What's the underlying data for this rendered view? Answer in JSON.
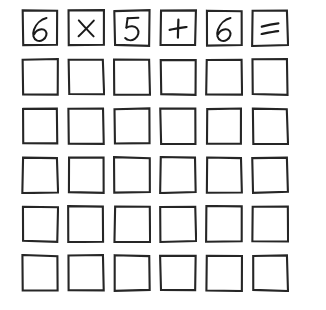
{
  "page": {
    "background_color": "#ffffff",
    "ink_color": "#1a1a1a",
    "border_color": "#262626",
    "width": 326,
    "height": 310
  },
  "grid": {
    "rows": 6,
    "columns": 6,
    "cell_size": 38,
    "column_gap": 8,
    "row_gap": 11,
    "origin_x": 21,
    "origin_y": 9,
    "border_width": 2,
    "style": "hand-drawn"
  },
  "expression": {
    "text": "6 × 5 + 6 =",
    "operands": [
      6,
      5,
      6
    ],
    "operators": [
      "×",
      "+"
    ],
    "terminator": "="
  },
  "cells": [
    [
      {
        "value": "6",
        "glyph": "digit-six",
        "filled": true
      },
      {
        "value": "×",
        "glyph": "multiplication-sign",
        "filled": true
      },
      {
        "value": "5",
        "glyph": "digit-five",
        "filled": true
      },
      {
        "value": "+",
        "glyph": "plus-sign",
        "filled": true
      },
      {
        "value": "6",
        "glyph": "digit-six",
        "filled": true
      },
      {
        "value": "=",
        "glyph": "equals-sign",
        "filled": true
      }
    ],
    [
      {
        "value": "",
        "glyph": "empty",
        "filled": false
      },
      {
        "value": "",
        "glyph": "empty",
        "filled": false
      },
      {
        "value": "",
        "glyph": "empty",
        "filled": false
      },
      {
        "value": "",
        "glyph": "empty",
        "filled": false
      },
      {
        "value": "",
        "glyph": "empty",
        "filled": false
      },
      {
        "value": "",
        "glyph": "empty",
        "filled": false
      }
    ],
    [
      {
        "value": "",
        "glyph": "empty",
        "filled": false
      },
      {
        "value": "",
        "glyph": "empty",
        "filled": false
      },
      {
        "value": "",
        "glyph": "empty",
        "filled": false
      },
      {
        "value": "",
        "glyph": "empty",
        "filled": false
      },
      {
        "value": "",
        "glyph": "empty",
        "filled": false
      },
      {
        "value": "",
        "glyph": "empty",
        "filled": false
      }
    ],
    [
      {
        "value": "",
        "glyph": "empty",
        "filled": false
      },
      {
        "value": "",
        "glyph": "empty",
        "filled": false
      },
      {
        "value": "",
        "glyph": "empty",
        "filled": false
      },
      {
        "value": "",
        "glyph": "empty",
        "filled": false
      },
      {
        "value": "",
        "glyph": "empty",
        "filled": false
      },
      {
        "value": "",
        "glyph": "empty",
        "filled": false
      }
    ],
    [
      {
        "value": "",
        "glyph": "empty",
        "filled": false
      },
      {
        "value": "",
        "glyph": "empty",
        "filled": false
      },
      {
        "value": "",
        "glyph": "empty",
        "filled": false
      },
      {
        "value": "",
        "glyph": "empty",
        "filled": false
      },
      {
        "value": "",
        "glyph": "empty",
        "filled": false
      },
      {
        "value": "",
        "glyph": "empty",
        "filled": false
      }
    ],
    [
      {
        "value": "",
        "glyph": "empty",
        "filled": false
      },
      {
        "value": "",
        "glyph": "empty",
        "filled": false
      },
      {
        "value": "",
        "glyph": "empty",
        "filled": false
      },
      {
        "value": "",
        "glyph": "empty",
        "filled": false
      },
      {
        "value": "",
        "glyph": "empty",
        "filled": false
      },
      {
        "value": "",
        "glyph": "empty",
        "filled": false
      }
    ]
  ]
}
